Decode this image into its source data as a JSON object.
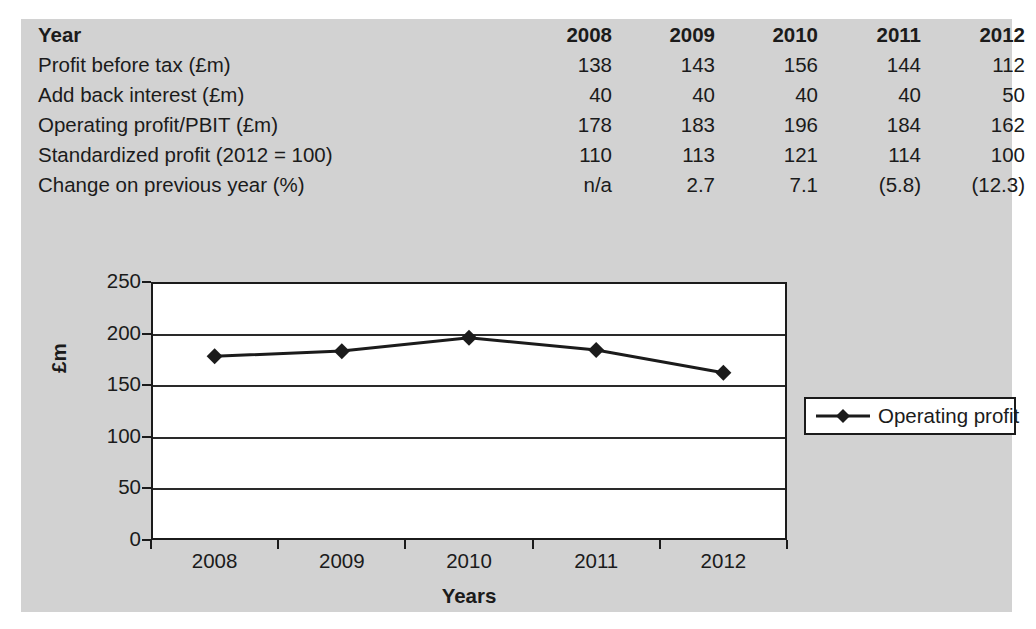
{
  "colors": {
    "panel_background": "#d2d2d2",
    "plot_background": "#ffffff",
    "ink": "#1b1b1b",
    "series": "#1b1b1b"
  },
  "table": {
    "header": {
      "label": "Year",
      "years": [
        "2008",
        "2009",
        "2010",
        "2011",
        "2012"
      ]
    },
    "rows": [
      {
        "label": "Profit before tax (£m)",
        "values": [
          "138",
          "143",
          "156",
          "144",
          "112"
        ]
      },
      {
        "label": "Add back interest (£m)",
        "values": [
          "40",
          "40",
          "40",
          "40",
          "50"
        ]
      },
      {
        "label": "Operating profit/PBIT (£m)",
        "values": [
          "178",
          "183",
          "196",
          "184",
          "162"
        ]
      },
      {
        "label": "Standardized profit (2012 = 100)",
        "values": [
          "110",
          "113",
          "121",
          "114",
          "100"
        ]
      },
      {
        "label": "Change on previous year (%)",
        "values": [
          "n/a",
          "2.7",
          "7.1",
          "(5.8)",
          "(12.3)"
        ]
      }
    ]
  },
  "chart_data": {
    "type": "line",
    "title": "",
    "xlabel": "Years",
    "ylabel": "£m",
    "categories": [
      "2008",
      "2009",
      "2010",
      "2011",
      "2012"
    ],
    "series": [
      {
        "name": "Operating profit",
        "values": [
          178,
          183,
          196,
          184,
          162
        ],
        "marker": "diamond",
        "color": "#1b1b1b"
      }
    ],
    "ylim": [
      0,
      250
    ],
    "ytick_values": [
      0,
      50,
      100,
      150,
      200,
      250
    ],
    "ytick_labels": [
      "0",
      "50",
      "100",
      "150",
      "200",
      "250"
    ],
    "grid": "horizontal",
    "legend_position": "right",
    "legend_entries": [
      "Operating profit"
    ]
  }
}
